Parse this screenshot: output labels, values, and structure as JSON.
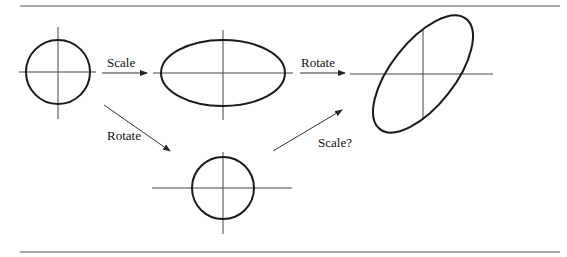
{
  "figure": {
    "labels": {
      "scale": "Scale",
      "rotate_top": "Rotate",
      "rotate_diag": "Rotate",
      "scale_question": "Scale?"
    },
    "shapes": [
      {
        "name": "original-circle",
        "type": "circle",
        "cx": 58,
        "cy": 72,
        "r": 32
      },
      {
        "name": "scaled-ellipse",
        "type": "ellipse",
        "cx": 223,
        "cy": 73,
        "rx": 62,
        "ry": 33
      },
      {
        "name": "rotated-ellipse",
        "type": "ellipse",
        "cx": 423,
        "cy": 74,
        "rx": 70,
        "ry": 32,
        "angle": -50
      },
      {
        "name": "rotated-circle",
        "type": "circle",
        "cx": 223,
        "cy": 188,
        "r": 31
      }
    ],
    "arrows": [
      {
        "name": "scale-arrow",
        "from": [
          102,
          73
        ],
        "to": [
          147,
          73
        ],
        "label": "Scale"
      },
      {
        "name": "rotate-arrow-top",
        "from": [
          300,
          73
        ],
        "to": [
          345,
          73
        ],
        "label": "Rotate"
      },
      {
        "name": "rotate-arrow-diag",
        "from": [
          104,
          105
        ],
        "to": [
          170,
          151
        ],
        "label": "Rotate"
      },
      {
        "name": "scale-question-arrow",
        "from": [
          273,
          151
        ],
        "to": [
          342,
          110
        ],
        "label": "Scale?"
      }
    ]
  }
}
